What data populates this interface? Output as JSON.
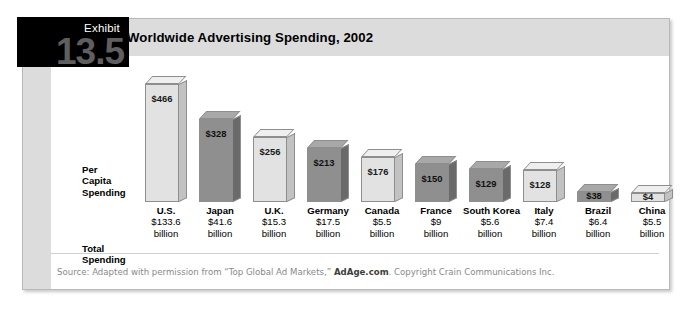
{
  "exhibit": {
    "label": "Exhibit",
    "number": "13.5"
  },
  "title": "Worldwide Advertising Spending, 2002",
  "row_labels": {
    "per_capita": "Per\nCapita\nSpending",
    "per_capita_line1": "Per",
    "per_capita_line2": "Capita",
    "per_capita_line3": "Spending",
    "total_line1": "Total",
    "total_line2": "Spending"
  },
  "source": {
    "prefix": "Source: Adapted with permission from “Top Global Ad Markets,” ",
    "bold": "AdAge.com",
    "suffix": ". Copyright Crain Communications Inc."
  },
  "colors": {
    "badge_background": "#000000",
    "badge_number": "#5f5f5f",
    "title_bar": "#dcdcdc",
    "bar_light_front": "#e2e2e2",
    "bar_dark_front": "#8f8f8f",
    "frame_border": "#b9b9b9",
    "source_text": "#8a8a8a"
  },
  "chart_data": {
    "type": "bar",
    "title": "Worldwide Advertising Spending, 2002",
    "xlabel": "",
    "ylabel": "Per Capita Spending",
    "ylim": [
      0,
      466
    ],
    "grid": false,
    "legend": "none",
    "categories": [
      "U.S.",
      "Japan",
      "U.K.",
      "Germany",
      "Canada",
      "France",
      "South Korea",
      "Italy",
      "Brazil",
      "China"
    ],
    "values": [
      466,
      328,
      256,
      213,
      176,
      150,
      129,
      128,
      38,
      4
    ],
    "value_labels": [
      "$466",
      "$328",
      "$256",
      "$213",
      "$176",
      "$150",
      "$129",
      "$128",
      "$38",
      "$4"
    ],
    "shades": [
      "light",
      "dark",
      "light",
      "dark",
      "light",
      "dark",
      "dark",
      "light",
      "dark",
      "light"
    ],
    "secondary_series": {
      "name": "Total Spending",
      "unit": "billion",
      "amounts": [
        "$133.6",
        "$41.6",
        "$15.3",
        "$17.5",
        "$5.5",
        "$9",
        "$5.6",
        "$7.4",
        "$6.4",
        "$5.5"
      ],
      "values": [
        133.6,
        41.6,
        15.3,
        17.5,
        5.5,
        9,
        5.6,
        7.4,
        6.4,
        5.5
      ]
    }
  }
}
